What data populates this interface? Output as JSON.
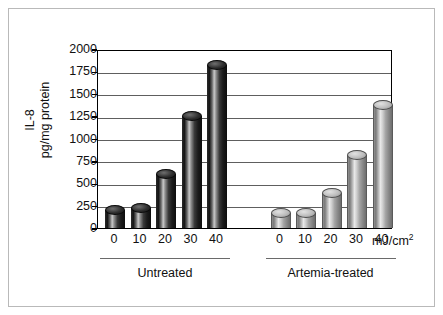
{
  "chart_data": {
    "type": "bar",
    "title": "",
    "xlabel": "mJ/cm2",
    "ylabel_line1": "IL-8",
    "ylabel_line2": "pg/mg protein",
    "ylim": [
      0,
      2000
    ],
    "yticks": [
      0,
      250,
      500,
      750,
      1000,
      1250,
      1500,
      1750,
      2000
    ],
    "ytick_labels": [
      "0",
      "250",
      "500",
      "750",
      "1000",
      "1250",
      "1500",
      "1750",
      "2000"
    ],
    "grid": true,
    "legend": "none",
    "categories": [
      "0",
      "10",
      "20",
      "30",
      "40",
      "0",
      "10",
      "20",
      "30",
      "40"
    ],
    "values": [
      200,
      225,
      600,
      1250,
      1825,
      170,
      170,
      390,
      820,
      1370
    ],
    "groups": [
      {
        "name": "Untreated",
        "style": "dark",
        "categories": [
          "0",
          "10",
          "20",
          "30",
          "40"
        ],
        "values": [
          200,
          225,
          600,
          1250,
          1825
        ]
      },
      {
        "name": "Artemia-treated",
        "style": "light",
        "categories": [
          "0",
          "10",
          "20",
          "30",
          "40"
        ],
        "values": [
          170,
          170,
          390,
          820,
          1370
        ]
      }
    ],
    "unit_label": "mJ/cm",
    "unit_exponent": "2"
  },
  "axis": {
    "y_title_line1": "IL-8",
    "y_title_line2": "pg/mg protein"
  },
  "colors": {
    "bar_dark": "#141414",
    "bar_light": "#b5b5b5",
    "gridline": "#5e5e5e",
    "axis": "#000000",
    "frame": "#b9b9b9",
    "text": "#111111",
    "background": "#ffffff"
  }
}
